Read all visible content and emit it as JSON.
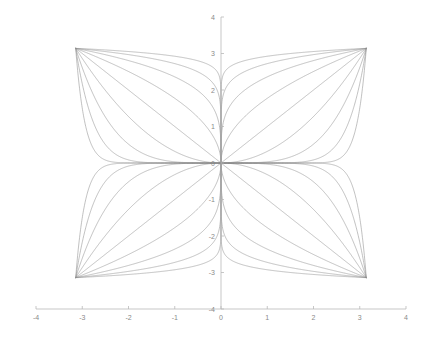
{
  "figure": {
    "background_color": "#ffffff",
    "axis_color": "#b9b9b9",
    "tick_label_color": "#8a8a8a",
    "curve_color": "#8e8e8e"
  },
  "chart_data": {
    "type": "line",
    "title": "",
    "subtitle": "",
    "xlabel": "",
    "ylabel": "",
    "xlim": [
      -4,
      4
    ],
    "ylim": [
      -4,
      4
    ],
    "xticks": [
      -4,
      -3,
      -2,
      -1,
      0,
      1,
      2,
      3,
      4
    ],
    "yticks": [
      -4,
      -3,
      -2,
      -1,
      0,
      1,
      2,
      3,
      4
    ],
    "xtick_labels": [
      "-4",
      "-3",
      "-2",
      "-1",
      "0",
      "1",
      "2",
      "3",
      "4"
    ],
    "ytick_labels": [
      "-4",
      "-3",
      "-2",
      "-1",
      "0",
      "1",
      "2",
      "3",
      "4"
    ],
    "grid": false,
    "legend": null,
    "legend_position": "none",
    "domain": [
      -3.14159,
      3.14159
    ],
    "corner_points": [
      [
        -3.14159,
        3.14159
      ],
      [
        3.14159,
        3.14159
      ],
      [
        -3.14159,
        -3.14159
      ],
      [
        3.14159,
        -3.14159
      ]
    ],
    "common_point": [
      0,
      0
    ],
    "scale": 3.14159,
    "exponents": [
      0.0625,
      0.125,
      0.25,
      0.5,
      1,
      2,
      4,
      8,
      16
    ],
    "series": [
      {
        "name": "n = 1/16",
        "exponent": 0.0625
      },
      {
        "name": "n = 1/8",
        "exponent": 0.125
      },
      {
        "name": "n = 1/4",
        "exponent": 0.25
      },
      {
        "name": "n = 1/2",
        "exponent": 0.5
      },
      {
        "name": "n = 1",
        "exponent": 1
      },
      {
        "name": "n = 2",
        "exponent": 2
      },
      {
        "name": "n = 4",
        "exponent": 4
      },
      {
        "name": "n = 8",
        "exponent": 8
      },
      {
        "name": "n = 16",
        "exponent": 16
      }
    ]
  },
  "axes": {
    "x_axis_name": "x-axis",
    "y_axis_name": "y-axis",
    "tick_length": 3
  }
}
